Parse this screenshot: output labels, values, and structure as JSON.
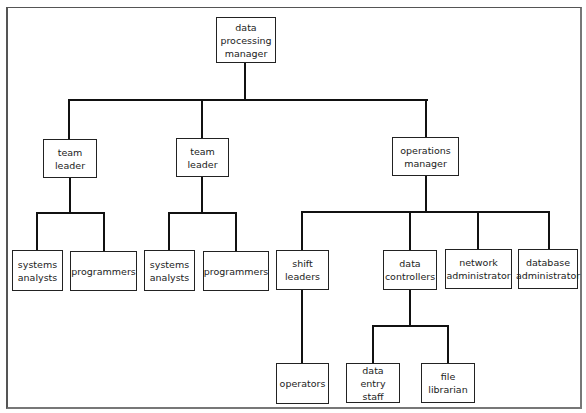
{
  "diagram": {
    "type": "organization-chart",
    "root": {
      "label": "data processing manager",
      "children": [
        {
          "label": "team leader",
          "children": [
            {
              "label": "systems analysts"
            },
            {
              "label": "programmers"
            }
          ]
        },
        {
          "label": "team leader",
          "children": [
            {
              "label": "systems analysts"
            },
            {
              "label": "programmers"
            }
          ]
        },
        {
          "label": "operations manager",
          "children": [
            {
              "label": "shift leaders",
              "children": [
                {
                  "label": "operators"
                }
              ]
            },
            {
              "label": "data controllers",
              "children": [
                {
                  "label": "data entry staff"
                },
                {
                  "label": "file librarian"
                }
              ]
            },
            {
              "label": "network administrator"
            },
            {
              "label": "database administrator"
            }
          ]
        }
      ]
    }
  },
  "nodes": {
    "dp_manager": "data processing manager",
    "team_leader_1": "team leader",
    "team_leader_2": "team leader",
    "operations_manager": "operations manager",
    "systems_analysts_1": "systems analysts",
    "programmers_1": "programmers",
    "systems_analysts_2": "systems analysts",
    "programmers_2": "programmers",
    "shift_leaders": "shift leaders",
    "data_controllers": "data controllers",
    "network_administrator": "network administrator",
    "database_administrator": "database administrator",
    "operators": "operators",
    "data_entry_staff": "data entry staff",
    "file_librarian": "file librarian"
  },
  "colors": {
    "line": "#111111",
    "box_border": "#222222",
    "background": "#ffffff"
  }
}
